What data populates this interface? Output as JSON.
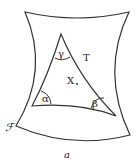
{
  "figure": {
    "surface_label": "ℱ",
    "triangle_label": "T",
    "point_label": "X",
    "angles": {
      "top": "γ",
      "left": "α",
      "right": "β"
    },
    "caption": "a"
  },
  "colors": {
    "stroke": "#333333",
    "background": "#ffffff"
  }
}
